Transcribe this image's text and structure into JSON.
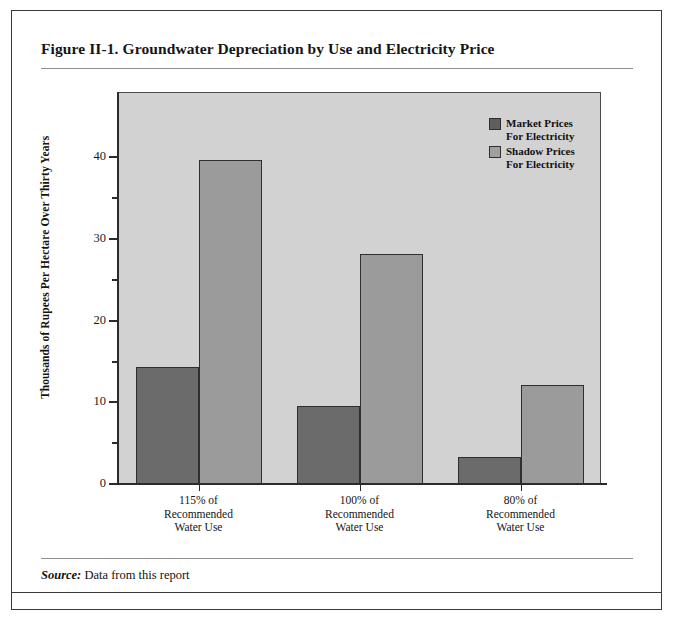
{
  "figure": {
    "title": "Figure II-1.  Groundwater Depreciation by Use and Electricity Price",
    "source_label": "Source:",
    "source_text": " Data from this report"
  },
  "chart_data": {
    "type": "bar",
    "title": "Figure II-1.  Groundwater Depreciation by Use and Electricity Price",
    "xlabel": "",
    "ylabel": "Thousands of Rupees Per Hectare Over Thirty Years",
    "categories": [
      "115% of\nRecommended\nWater Use",
      "100% of\nRecommended\nWater Use",
      "80% of\nRecommended\nWater Use"
    ],
    "category_lines": [
      [
        "115% of",
        "Recommended",
        "Water Use"
      ],
      [
        "100% of",
        "Recommended",
        "Water Use"
      ],
      [
        "80% of",
        "Recommended",
        "Water Use"
      ]
    ],
    "series": [
      {
        "name": "Market Prices\nFor Electricity",
        "name_lines": [
          "Market Prices",
          "For Electricity"
        ],
        "color": "#6b6b6b",
        "values": [
          14.3,
          9.5,
          3.3
        ]
      },
      {
        "name": "Shadow Prices\nFor Electricity",
        "name_lines": [
          "Shadow Prices",
          "For Electricity"
        ],
        "color": "#9b9b9b",
        "values": [
          39.7,
          28.2,
          12.1
        ]
      }
    ],
    "ylim": [
      0,
      48
    ],
    "yticks": [
      0,
      10,
      20,
      30,
      40
    ],
    "ytick_labels": [
      "0",
      "10",
      "20",
      "30",
      "40"
    ],
    "yticks_minor": [
      5,
      15,
      25,
      35
    ],
    "grid": false,
    "legend_position": "top-right-inside",
    "plot_background": "#d2d2d2"
  }
}
